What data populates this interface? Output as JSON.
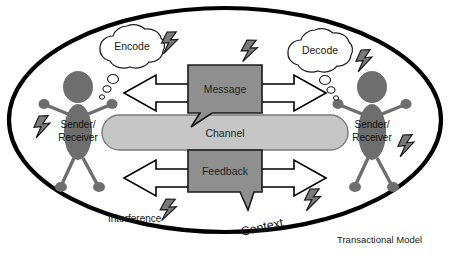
{
  "diagram": {
    "title": "Transactional Model",
    "outer_boundary": {
      "name": "Context",
      "label": "Context",
      "shape": "ellipse",
      "stroke": "#000000",
      "fill": "#ffffff"
    },
    "clouds": [
      {
        "id": "encode",
        "label": "Encode",
        "side": "left"
      },
      {
        "id": "decode",
        "label": "Decode",
        "side": "right"
      }
    ],
    "people": [
      {
        "id": "person-left",
        "label_line1": "Sender/",
        "label_line2": "Receiver",
        "side": "left"
      },
      {
        "id": "person-right",
        "label_line1": "Sender/",
        "label_line2": "Receiver",
        "side": "right"
      }
    ],
    "boxes": [
      {
        "id": "message",
        "label": "Message",
        "fill": "#8f8f8f",
        "stroke": "#1a1a1a"
      },
      {
        "id": "feedback",
        "label": "Feedback",
        "fill": "#8f8f8f",
        "stroke": "#1a1a1a"
      }
    ],
    "channel": {
      "id": "channel",
      "label": "Channel",
      "fill": "#c6c6c6",
      "stroke": "#6b6b6b"
    },
    "interference": {
      "label": "Interference",
      "bolt_count": 7
    },
    "arrows": [
      {
        "id": "message-arrow-left",
        "direction": "left",
        "fill": "#ffffff",
        "stroke": "#000000"
      },
      {
        "id": "message-arrow-right",
        "direction": "right",
        "fill": "#ffffff",
        "stroke": "#000000"
      },
      {
        "id": "feedback-arrow-left",
        "direction": "left",
        "fill": "#ffffff",
        "stroke": "#000000"
      },
      {
        "id": "feedback-arrow-right",
        "direction": "right",
        "fill": "#ffffff",
        "stroke": "#000000"
      }
    ],
    "colors": {
      "person": "#6e6e6e",
      "bolt_fill": "#7a7a7a",
      "bolt_stroke": "#1a1a1a",
      "box_fill": "#8f8f8f",
      "channel_fill": "#c6c6c6",
      "outline": "#000000",
      "background": "#ffffff"
    }
  }
}
